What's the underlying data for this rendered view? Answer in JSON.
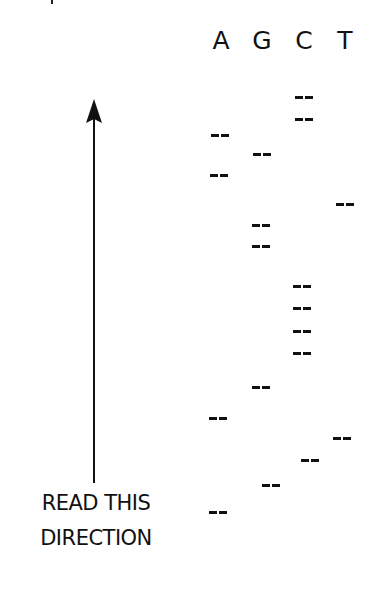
{
  "diagram": {
    "type": "dna-sequencing-gel",
    "lanes": [
      {
        "label": "A",
        "x": 206
      },
      {
        "label": "G",
        "x": 247
      },
      {
        "label": "C",
        "x": 289
      },
      {
        "label": "T",
        "x": 330
      }
    ],
    "bands": [
      {
        "lane": "C",
        "x": 295,
        "y": 96
      },
      {
        "lane": "C",
        "x": 295,
        "y": 118
      },
      {
        "lane": "A",
        "x": 211,
        "y": 134
      },
      {
        "lane": "G",
        "x": 253,
        "y": 153
      },
      {
        "lane": "A",
        "x": 210,
        "y": 174
      },
      {
        "lane": "T",
        "x": 336,
        "y": 203
      },
      {
        "lane": "G",
        "x": 252,
        "y": 224
      },
      {
        "lane": "G",
        "x": 252,
        "y": 245
      },
      {
        "lane": "C",
        "x": 293,
        "y": 285
      },
      {
        "lane": "C",
        "x": 293,
        "y": 307
      },
      {
        "lane": "C",
        "x": 293,
        "y": 330
      },
      {
        "lane": "C",
        "x": 293,
        "y": 352
      },
      {
        "lane": "G",
        "x": 252,
        "y": 386
      },
      {
        "lane": "A",
        "x": 209,
        "y": 417
      },
      {
        "lane": "T",
        "x": 333,
        "y": 437
      },
      {
        "lane": "C",
        "x": 301,
        "y": 459
      },
      {
        "lane": "G",
        "x": 262,
        "y": 484
      },
      {
        "lane": "A",
        "x": 209,
        "y": 511
      }
    ],
    "read_arrow": {
      "direction": "up",
      "icon": "arrow-up-icon"
    },
    "caption": {
      "line1": "READ THIS",
      "line2": "DIRECTION"
    }
  }
}
